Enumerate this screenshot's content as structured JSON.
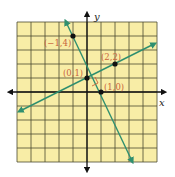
{
  "diagram": {
    "type": "coordinate-plane",
    "grid": {
      "xmin": -5,
      "xmax": 5,
      "ymin": -5,
      "ymax": 5,
      "fill": "#f8eda6",
      "line_color": "#3a3a2a"
    },
    "axes": {
      "x_label": "x",
      "y_label": "y"
    },
    "line_color": "#2f8f6f",
    "lines": [
      {
        "name": "line-through-neg1-4-and-1-0",
        "points": [
          [
            -1,
            4
          ],
          [
            1,
            0
          ]
        ],
        "slope": -2
      },
      {
        "name": "line-through-0-1-and-2-2",
        "points": [
          [
            0,
            1
          ],
          [
            2,
            2
          ]
        ],
        "slope": 0.5
      }
    ],
    "points": [
      {
        "label": "(−1,4)",
        "x": -1,
        "y": 4
      },
      {
        "label": "(2,2)",
        "x": 2,
        "y": 2
      },
      {
        "label": "(0,1)",
        "x": 0,
        "y": 1
      },
      {
        "label": "(1,0)",
        "x": 1,
        "y": 0
      }
    ],
    "right_angle_marker": true
  }
}
